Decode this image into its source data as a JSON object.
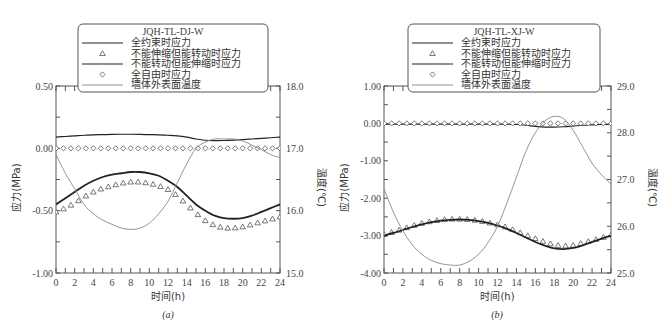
{
  "chart_data": [
    {
      "type": "line",
      "panel": "(a)",
      "legend_title": "JQH-TL-DJ-W",
      "xlabel": "时间(h)",
      "ylabel": "应力(MPa)",
      "y2label": "温度(℃)",
      "xlim": [
        0,
        24
      ],
      "ylim": [
        -1.0,
        0.5
      ],
      "y2lim": [
        15.0,
        18.0
      ],
      "xticks": [
        "0",
        "2",
        "4",
        "6",
        "8",
        "10",
        "12",
        "14",
        "16",
        "18",
        "20",
        "22",
        "24"
      ],
      "yticks": [
        "-1.00",
        "-0.50",
        "0.00",
        "0.50"
      ],
      "y2ticks": [
        "15.0",
        "16.0",
        "17.0",
        "18.0"
      ],
      "x": [
        0,
        1,
        2,
        3,
        4,
        5,
        6,
        7,
        8,
        9,
        10,
        11,
        12,
        13,
        14,
        15,
        16,
        17,
        18,
        19,
        20,
        21,
        22,
        23,
        24
      ],
      "series": [
        {
          "name": "全约束时应力",
          "style": "line",
          "axis": "left",
          "values": [
            0.09,
            0.095,
            0.1,
            0.105,
            0.108,
            0.11,
            0.112,
            0.113,
            0.113,
            0.112,
            0.11,
            0.108,
            0.105,
            0.1,
            0.09,
            0.075,
            0.065,
            0.062,
            0.063,
            0.066,
            0.07,
            0.075,
            0.08,
            0.085,
            0.09
          ]
        },
        {
          "name": "不能伸缩但能转动时应力",
          "style": "triangle",
          "axis": "left",
          "values": [
            -0.51,
            -0.48,
            -0.44,
            -0.39,
            -0.35,
            -0.32,
            -0.3,
            -0.28,
            -0.27,
            -0.27,
            -0.28,
            -0.3,
            -0.33,
            -0.38,
            -0.45,
            -0.52,
            -0.58,
            -0.62,
            -0.64,
            -0.64,
            -0.63,
            -0.61,
            -0.59,
            -0.57,
            -0.55
          ]
        },
        {
          "name": "不能转动但能伸缩时应力",
          "style": "line",
          "axis": "left",
          "values": [
            -0.45,
            -0.4,
            -0.35,
            -0.3,
            -0.26,
            -0.23,
            -0.21,
            -0.2,
            -0.19,
            -0.19,
            -0.2,
            -0.22,
            -0.26,
            -0.31,
            -0.38,
            -0.45,
            -0.5,
            -0.54,
            -0.56,
            -0.565,
            -0.56,
            -0.54,
            -0.51,
            -0.48,
            -0.45
          ]
        },
        {
          "name": "全自由时应力",
          "style": "diamond",
          "axis": "left",
          "values": [
            0,
            0,
            0,
            0,
            0,
            0,
            0,
            0,
            0,
            0,
            0,
            0,
            0,
            0,
            0,
            0,
            0,
            0,
            0,
            0,
            0,
            0,
            0,
            0,
            0
          ]
        },
        {
          "name": "墙体外表面温度",
          "style": "thin-line",
          "axis": "right",
          "values": [
            16.9,
            16.6,
            16.35,
            16.1,
            15.95,
            15.85,
            15.78,
            15.72,
            15.7,
            15.72,
            15.8,
            15.95,
            16.15,
            16.45,
            16.75,
            17.0,
            17.1,
            17.15,
            17.15,
            17.15,
            17.12,
            17.05,
            16.98,
            16.9,
            16.85
          ]
        }
      ]
    },
    {
      "type": "line",
      "panel": "(b)",
      "legend_title": "JQH-TL-XJ-W",
      "xlabel": "时间(h)",
      "ylabel": "应力(MPa)",
      "y2label": "温度(℃)",
      "xlim": [
        0,
        24
      ],
      "ylim": [
        -4.0,
        1.0
      ],
      "y2lim": [
        25.0,
        29.0
      ],
      "xticks": [
        "0",
        "2",
        "4",
        "6",
        "8",
        "10",
        "12",
        "14",
        "16",
        "18",
        "20",
        "22",
        "24"
      ],
      "yticks": [
        "-4.00",
        "-3.00",
        "-2.00",
        "-1.00",
        "0.00",
        "1.00"
      ],
      "y2ticks": [
        "25.0",
        "26.0",
        "27.0",
        "28.0",
        "29.0"
      ],
      "x": [
        0,
        1,
        2,
        3,
        4,
        5,
        6,
        7,
        8,
        9,
        10,
        11,
        12,
        13,
        14,
        15,
        16,
        17,
        18,
        19,
        20,
        21,
        22,
        23,
        24
      ],
      "series": [
        {
          "name": "全约束时应力",
          "style": "line",
          "axis": "left",
          "values": [
            -0.02,
            -0.02,
            -0.02,
            -0.02,
            -0.02,
            -0.02,
            -0.02,
            -0.02,
            -0.02,
            -0.02,
            -0.02,
            -0.02,
            -0.02,
            -0.02,
            -0.03,
            -0.05,
            -0.08,
            -0.1,
            -0.1,
            -0.09,
            -0.07,
            -0.05,
            -0.04,
            -0.03,
            -0.02
          ]
        },
        {
          "name": "不能伸缩但能转动时应力",
          "style": "triangle",
          "axis": "left",
          "values": [
            -2.97,
            -2.9,
            -2.82,
            -2.74,
            -2.67,
            -2.62,
            -2.58,
            -2.56,
            -2.56,
            -2.57,
            -2.6,
            -2.65,
            -2.71,
            -2.78,
            -2.88,
            -2.98,
            -3.08,
            -3.17,
            -3.25,
            -3.28,
            -3.26,
            -3.2,
            -3.13,
            -3.06,
            -2.98
          ]
        },
        {
          "name": "不能转动但能伸缩时应力",
          "style": "line",
          "axis": "left",
          "values": [
            -3.0,
            -2.93,
            -2.85,
            -2.77,
            -2.7,
            -2.64,
            -2.6,
            -2.58,
            -2.57,
            -2.58,
            -2.61,
            -2.66,
            -2.73,
            -2.82,
            -2.93,
            -3.05,
            -3.17,
            -3.27,
            -3.34,
            -3.36,
            -3.33,
            -3.26,
            -3.17,
            -3.08,
            -3.0
          ]
        },
        {
          "name": "全自由时应力",
          "style": "diamond",
          "axis": "left",
          "values": [
            0,
            0,
            0,
            0,
            0,
            0,
            0,
            0,
            0,
            0,
            0,
            0,
            0,
            0,
            0,
            0,
            0,
            0,
            0,
            0,
            0,
            0,
            0,
            0,
            0
          ]
        },
        {
          "name": "墙体外表面温度",
          "style": "thin-line",
          "axis": "right",
          "values": [
            26.8,
            26.3,
            25.9,
            25.6,
            25.4,
            25.27,
            25.2,
            25.17,
            25.17,
            25.25,
            25.4,
            25.65,
            26.0,
            26.5,
            27.05,
            27.6,
            28.0,
            28.25,
            28.35,
            28.3,
            28.05,
            27.7,
            27.35,
            27.1,
            26.9
          ]
        }
      ]
    }
  ],
  "legend": {
    "items": [
      "全约束时应力",
      "不能伸缩但能转动时应力",
      "不能转动但能伸缩时应力",
      "全自由时应力",
      "墙体外表面温度"
    ]
  },
  "captions": [
    "(a)",
    "(b)"
  ]
}
